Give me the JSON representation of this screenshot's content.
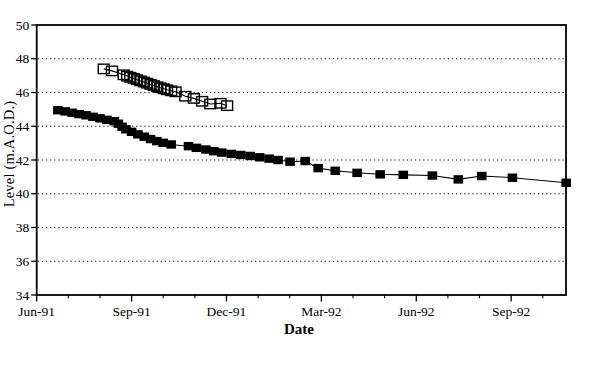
{
  "figure": {
    "background_color": "#ffffff",
    "ink_color": "#000000"
  },
  "chart_data": {
    "type": "line",
    "title": "",
    "xlabel": "Date",
    "ylabel": "Level (m.A.O.D.)",
    "legend": "none",
    "x_axis": {
      "unit": "months after Jun-91 tick",
      "major_ticks": [
        {
          "m": 0,
          "label": "Jun-91"
        },
        {
          "m": 3,
          "label": "Sep-91"
        },
        {
          "m": 6,
          "label": "Dec-91"
        },
        {
          "m": 9,
          "label": "Mar-92"
        },
        {
          "m": 12,
          "label": "Jun-92"
        },
        {
          "m": 15,
          "label": "Sep-92"
        }
      ],
      "minor_tick_months": [
        1,
        2,
        4,
        5,
        7,
        8,
        10,
        11,
        13,
        14,
        16
      ],
      "range_months": [
        0,
        16.8
      ]
    },
    "y_axis": {
      "tick_values": [
        50,
        48,
        46,
        44,
        42,
        40,
        38,
        36,
        34
      ],
      "gridline_values": [
        48,
        46,
        44,
        42,
        40,
        38,
        36
      ],
      "gridline_style": "dotted",
      "range": [
        34,
        50
      ]
    },
    "series": [
      {
        "marker": "filled-square",
        "color": "#000000",
        "point_format": [
          "months_after_jun91",
          "level_m_aod"
        ],
        "points": [
          [
            0.67,
            44.95
          ],
          [
            0.9,
            44.88
          ],
          [
            1.12,
            44.8
          ],
          [
            1.34,
            44.72
          ],
          [
            1.56,
            44.65
          ],
          [
            1.78,
            44.56
          ],
          [
            2.0,
            44.47
          ],
          [
            2.22,
            44.38
          ],
          [
            2.45,
            44.3
          ],
          [
            2.58,
            44.15
          ],
          [
            2.7,
            43.97
          ],
          [
            2.82,
            43.82
          ],
          [
            3.0,
            43.67
          ],
          [
            3.2,
            43.52
          ],
          [
            3.4,
            43.38
          ],
          [
            3.6,
            43.24
          ],
          [
            3.8,
            43.12
          ],
          [
            4.0,
            43.02
          ],
          [
            4.25,
            42.92
          ],
          [
            4.8,
            42.82
          ],
          [
            5.05,
            42.72
          ],
          [
            5.35,
            42.62
          ],
          [
            5.6,
            42.52
          ],
          [
            5.85,
            42.44
          ],
          [
            6.15,
            42.36
          ],
          [
            6.45,
            42.3
          ],
          [
            6.75,
            42.24
          ],
          [
            7.05,
            42.16
          ],
          [
            7.35,
            42.08
          ],
          [
            7.63,
            42.0
          ],
          [
            8.01,
            41.9
          ],
          [
            8.49,
            41.94
          ],
          [
            8.9,
            41.52
          ],
          [
            9.44,
            41.36
          ],
          [
            10.13,
            41.24
          ],
          [
            10.86,
            41.15
          ],
          [
            11.59,
            41.12
          ],
          [
            12.51,
            41.08
          ],
          [
            13.33,
            40.85
          ],
          [
            14.07,
            41.05
          ],
          [
            15.04,
            40.95
          ],
          [
            16.74,
            40.65
          ]
        ]
      },
      {
        "marker": "open-square",
        "color": "#000000",
        "point_format": [
          "months_after_jun91",
          "level_m_aod"
        ],
        "points": [
          [
            2.12,
            47.4
          ],
          [
            2.38,
            47.28
          ],
          [
            2.75,
            47.05
          ],
          [
            2.86,
            46.97
          ],
          [
            2.96,
            46.9
          ],
          [
            3.07,
            46.83
          ],
          [
            3.17,
            46.76
          ],
          [
            3.28,
            46.69
          ],
          [
            3.39,
            46.62
          ],
          [
            3.49,
            46.55
          ],
          [
            3.6,
            46.48
          ],
          [
            3.7,
            46.41
          ],
          [
            3.81,
            46.34
          ],
          [
            3.91,
            46.28
          ],
          [
            4.02,
            46.22
          ],
          [
            4.12,
            46.16
          ],
          [
            4.25,
            46.1
          ],
          [
            4.39,
            46.04
          ],
          [
            4.7,
            45.78
          ],
          [
            4.97,
            45.65
          ],
          [
            5.23,
            45.48
          ],
          [
            5.49,
            45.32
          ],
          [
            5.81,
            45.36
          ],
          [
            6.02,
            45.22
          ]
        ]
      }
    ]
  }
}
